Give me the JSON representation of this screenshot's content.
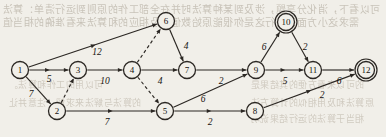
{
  "figure": {
    "type": "directed-weighted-graph",
    "background_color": "#f1efe9",
    "ink_color": "#2b2723",
    "terminal_node_style": "double-circle"
  },
  "bleed_through_text": {
    "line1": "可以看下，消化分享题，涉及到某种算法时并在全部工作的原则到运行清单：算法",
    "line2": "需求这小方面来进行这是你很能原始数值以及相应的和算法来看准确的相当值",
    "line3": "可以用的工作和算法。",
    "line4": "的算法与解法来求解，注意并让",
    "line5": "的可以来看方便的其结果是",
    "line6": "原算法和及用相似的计算方法",
    "line7": "相当于算法的运行结果说明"
  },
  "graph": {
    "nodes": [
      {
        "id": "1",
        "label": "1",
        "x": 20,
        "y": 70,
        "double": false
      },
      {
        "id": "2",
        "label": "2",
        "x": 57,
        "y": 111,
        "double": false
      },
      {
        "id": "3",
        "label": "3",
        "x": 78,
        "y": 70,
        "double": false
      },
      {
        "id": "4",
        "label": "4",
        "x": 132,
        "y": 70,
        "double": false
      },
      {
        "id": "5",
        "label": "5",
        "x": 165,
        "y": 111,
        "double": false
      },
      {
        "id": "6",
        "label": "6",
        "x": 166,
        "y": 21,
        "double": false
      },
      {
        "id": "7",
        "label": "7",
        "x": 187,
        "y": 70,
        "double": false
      },
      {
        "id": "8",
        "label": "8",
        "x": 255,
        "y": 111,
        "double": false
      },
      {
        "id": "9",
        "label": "9",
        "x": 256,
        "y": 70,
        "double": false
      },
      {
        "id": "10",
        "label": "10",
        "x": 286,
        "y": 22,
        "double": true
      },
      {
        "id": "11",
        "label": "11",
        "x": 313,
        "y": 70,
        "double": false
      },
      {
        "id": "12",
        "label": "12",
        "x": 366,
        "y": 70,
        "double": true
      }
    ],
    "node_radius": 8.5,
    "node_radius_outer": 11,
    "edges": [
      {
        "from": "1",
        "to": "6",
        "weight": "12",
        "dashed": false,
        "wx": 97,
        "wy": 52,
        "arrow_at_mid": true
      },
      {
        "from": "1",
        "to": "3",
        "weight": "5",
        "dashed": false,
        "wx": 49,
        "wy": 79,
        "arrow_at_mid": true
      },
      {
        "from": "1",
        "to": "2",
        "weight": "7",
        "dashed": false,
        "wx": 31,
        "wy": 94,
        "arrow_at_mid": false
      },
      {
        "from": "2",
        "to": "3",
        "weight": "",
        "dashed": true,
        "wx": 0,
        "wy": 0,
        "arrow_at_mid": false
      },
      {
        "from": "2",
        "to": "5",
        "weight": "7",
        "dashed": false,
        "wx": 107,
        "wy": 122,
        "arrow_at_mid": true
      },
      {
        "from": "3",
        "to": "4",
        "weight": "10",
        "dashed": false,
        "wx": 105,
        "wy": 81,
        "arrow_at_mid": false
      },
      {
        "from": "4",
        "to": "6",
        "weight": "",
        "dashed": true,
        "wx": 0,
        "wy": 0,
        "arrow_at_mid": false
      },
      {
        "from": "4",
        "to": "7",
        "weight": "4",
        "dashed": false,
        "wx": 160,
        "wy": 81,
        "arrow_at_mid": false
      },
      {
        "from": "4",
        "to": "5",
        "weight": "",
        "dashed": true,
        "wx": 0,
        "wy": 0,
        "arrow_at_mid": false
      },
      {
        "from": "6",
        "to": "7",
        "weight": "4",
        "dashed": false,
        "wx": 186,
        "wy": 46,
        "arrow_at_mid": false
      },
      {
        "from": "7",
        "to": "9",
        "weight": "2",
        "dashed": false,
        "wx": 221,
        "wy": 81,
        "arrow_at_mid": false
      },
      {
        "from": "5",
        "to": "9",
        "weight": "6",
        "dashed": false,
        "wx": 203,
        "wy": 99,
        "arrow_at_mid": false
      },
      {
        "from": "5",
        "to": "8",
        "weight": "2",
        "dashed": false,
        "wx": 210,
        "wy": 122,
        "arrow_at_mid": true
      },
      {
        "from": "9",
        "to": "10",
        "weight": "6",
        "dashed": false,
        "wx": 264,
        "wy": 47,
        "arrow_at_mid": false
      },
      {
        "from": "9",
        "to": "11",
        "weight": "5",
        "dashed": false,
        "wx": 285,
        "wy": 81,
        "arrow_at_mid": true
      },
      {
        "from": "10",
        "to": "11",
        "weight": "2",
        "dashed": false,
        "wx": 305,
        "wy": 47,
        "arrow_at_mid": false
      },
      {
        "from": "11",
        "to": "12",
        "weight": "6",
        "dashed": false,
        "wx": 339,
        "wy": 81,
        "arrow_at_mid": false
      },
      {
        "from": "8",
        "to": "12",
        "weight": "2",
        "dashed": false,
        "wx": 322,
        "wy": 95,
        "arrow_at_mid": true
      }
    ]
  }
}
